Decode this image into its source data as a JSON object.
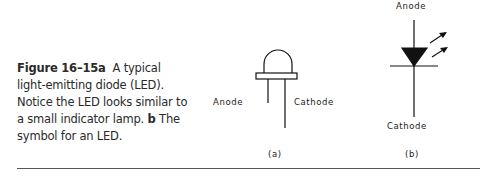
{
  "caption": {
    "figure_label": "Figure 16–15a",
    "text_a": "A typical light-emitting diode (LED). Notice the LED looks similar to a small indicator lamp.",
    "label_b": "b",
    "text_b": "The symbol for an LED."
  },
  "figure_a": {
    "anode_label": "Anode",
    "cathode_label": "Cathode",
    "sub_label": "(a)"
  },
  "figure_b": {
    "anode_label": "Anode",
    "cathode_label": "Cathode",
    "sub_label": "(b)"
  },
  "colors": {
    "ink": "#111111",
    "text": "#2a2a2a",
    "rule": "#555555"
  }
}
